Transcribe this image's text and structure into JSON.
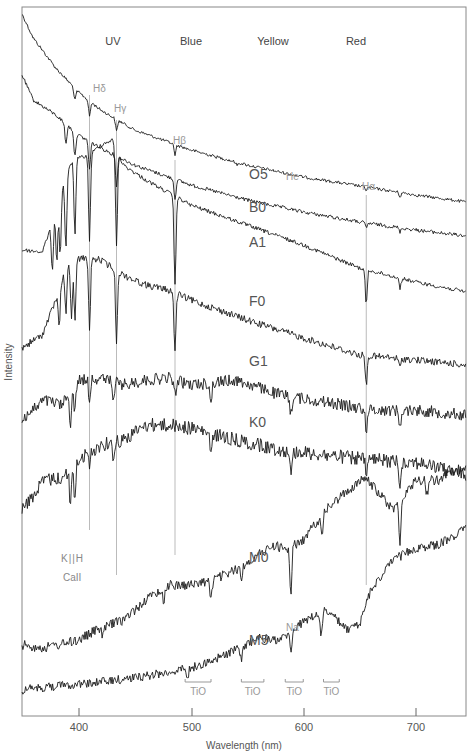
{
  "chart_data": {
    "type": "line",
    "title": "",
    "xlabel": "Wavelength (nm)",
    "ylabel": "Intensity",
    "xlim": [
      350,
      745
    ],
    "xticks": [
      400,
      500,
      600,
      700
    ],
    "grid": false,
    "color_bands": [
      {
        "label": "UV",
        "x": 418
      },
      {
        "label": "Blue",
        "x": 486
      },
      {
        "label": "Yellow",
        "x": 560
      },
      {
        "label": "Red",
        "x": 632
      }
    ],
    "series": [
      {
        "name": "O5",
        "label_x": 570,
        "label_y": 173,
        "anchors": [
          [
            350,
            14
          ],
          [
            360,
            38
          ],
          [
            380,
            68
          ],
          [
            400,
            92
          ],
          [
            420,
            110
          ],
          [
            450,
            130
          ],
          [
            500,
            150
          ],
          [
            550,
            165
          ],
          [
            600,
            177
          ],
          [
            650,
            186
          ],
          [
            700,
            195
          ],
          [
            745,
            202
          ]
        ],
        "noise": 1.5,
        "lines": [
          [
            397,
            12
          ],
          [
            410,
            15
          ],
          [
            434,
            12
          ],
          [
            486,
            10
          ],
          [
            541,
            3
          ],
          [
            656,
            3
          ],
          [
            686,
            4
          ]
        ]
      },
      {
        "name": "B0",
        "label_x": 570,
        "label_y": 208,
        "anchors": [
          [
            350,
            75
          ],
          [
            360,
            100
          ],
          [
            380,
            115
          ],
          [
            400,
            135
          ],
          [
            420,
            148
          ],
          [
            450,
            165
          ],
          [
            500,
            185
          ],
          [
            550,
            200
          ],
          [
            600,
            212
          ],
          [
            650,
            222
          ],
          [
            700,
            230
          ],
          [
            745,
            236
          ]
        ],
        "noise": 1.8,
        "lines": [
          [
            389,
            20
          ],
          [
            397,
            25
          ],
          [
            410,
            28
          ],
          [
            434,
            30
          ],
          [
            486,
            20
          ],
          [
            656,
            5
          ],
          [
            686,
            4
          ]
        ]
      },
      {
        "name": "A1",
        "label_x": 570,
        "label_y": 243,
        "anchors": [
          [
            350,
            250
          ],
          [
            368,
            252
          ],
          [
            378,
            220
          ],
          [
            385,
            190
          ],
          [
            395,
            160
          ],
          [
            410,
            155
          ],
          [
            420,
            145
          ],
          [
            430,
            140
          ],
          [
            440,
            165
          ],
          [
            460,
            180
          ],
          [
            500,
            205
          ],
          [
            550,
            225
          ],
          [
            600,
            245
          ],
          [
            650,
            268
          ],
          [
            700,
            282
          ],
          [
            745,
            292
          ]
        ],
        "noise": 2.0,
        "lines": [
          [
            377,
            50
          ],
          [
            381,
            55
          ],
          [
            384,
            60
          ],
          [
            389,
            70
          ],
          [
            397,
            75
          ],
          [
            410,
            85
          ],
          [
            434,
            95
          ],
          [
            486,
            90
          ],
          [
            656,
            35
          ],
          [
            686,
            10
          ]
        ]
      },
      {
        "name": "F0",
        "label_x": 570,
        "label_y": 303,
        "anchors": [
          [
            350,
            348
          ],
          [
            368,
            335
          ],
          [
            380,
            300
          ],
          [
            388,
            270
          ],
          [
            395,
            260
          ],
          [
            405,
            258
          ],
          [
            420,
            260
          ],
          [
            440,
            275
          ],
          [
            460,
            285
          ],
          [
            480,
            290
          ],
          [
            500,
            300
          ],
          [
            550,
            320
          ],
          [
            600,
            338
          ],
          [
            650,
            355
          ],
          [
            700,
            360
          ],
          [
            745,
            365
          ]
        ],
        "noise": 3.5,
        "lines": [
          [
            383,
            40
          ],
          [
            389,
            45
          ],
          [
            394,
            60
          ],
          [
            397,
            60
          ],
          [
            410,
            70
          ],
          [
            434,
            70
          ],
          [
            486,
            60
          ],
          [
            656,
            30
          ],
          [
            686,
            10
          ]
        ]
      },
      {
        "name": "G1",
        "label_x": 570,
        "label_y": 362,
        "anchors": [
          [
            350,
            420
          ],
          [
            370,
            400
          ],
          [
            385,
            405
          ],
          [
            392,
            395
          ],
          [
            400,
            380
          ],
          [
            420,
            378
          ],
          [
            440,
            385
          ],
          [
            460,
            380
          ],
          [
            480,
            378
          ],
          [
            500,
            385
          ],
          [
            540,
            380
          ],
          [
            580,
            395
          ],
          [
            620,
            402
          ],
          [
            660,
            410
          ],
          [
            700,
            410
          ],
          [
            745,
            415
          ]
        ],
        "noise": 6.0,
        "lines": [
          [
            393,
            30
          ],
          [
            397,
            28
          ],
          [
            410,
            20
          ],
          [
            431,
            20
          ],
          [
            486,
            15
          ],
          [
            518,
            22
          ],
          [
            589,
            18
          ],
          [
            656,
            20
          ],
          [
            686,
            20
          ]
        ]
      },
      {
        "name": "K0",
        "label_x": 570,
        "label_y": 423,
        "anchors": [
          [
            350,
            510
          ],
          [
            370,
            480
          ],
          [
            385,
            478
          ],
          [
            393,
            470
          ],
          [
            400,
            460
          ],
          [
            420,
            445
          ],
          [
            440,
            440
          ],
          [
            460,
            425
          ],
          [
            480,
            425
          ],
          [
            500,
            428
          ],
          [
            540,
            440
          ],
          [
            580,
            450
          ],
          [
            620,
            455
          ],
          [
            660,
            460
          ],
          [
            700,
            462
          ],
          [
            745,
            475
          ]
        ],
        "noise": 7.0,
        "lines": [
          [
            393,
            35
          ],
          [
            397,
            35
          ],
          [
            410,
            15
          ],
          [
            431,
            15
          ],
          [
            518,
            25
          ],
          [
            589,
            25
          ],
          [
            656,
            15
          ],
          [
            686,
            25
          ]
        ]
      },
      {
        "name": "M0",
        "label_x": 570,
        "label_y": 558,
        "anchors": [
          [
            350,
            645
          ],
          [
            370,
            648
          ],
          [
            400,
            640
          ],
          [
            420,
            628
          ],
          [
            440,
            620
          ],
          [
            460,
            600
          ],
          [
            480,
            585
          ],
          [
            500,
            585
          ],
          [
            520,
            580
          ],
          [
            540,
            570
          ],
          [
            560,
            555
          ],
          [
            575,
            545
          ],
          [
            585,
            550
          ],
          [
            600,
            540
          ],
          [
            620,
            510
          ],
          [
            640,
            490
          ],
          [
            655,
            478
          ],
          [
            665,
            490
          ],
          [
            680,
            510
          ],
          [
            700,
            480
          ],
          [
            720,
            480
          ],
          [
            745,
            465
          ]
        ],
        "noise": 5.0,
        "lines": [
          [
            422,
            10
          ],
          [
            476,
            15
          ],
          [
            518,
            20
          ],
          [
            545,
            15
          ],
          [
            589,
            45
          ],
          [
            617,
            20
          ],
          [
            686,
            40
          ],
          [
            710,
            15
          ]
        ]
      },
      {
        "name": "M5",
        "label_x": 570,
        "label_y": 643,
        "anchors": [
          [
            350,
            690
          ],
          [
            380,
            686
          ],
          [
            420,
            682
          ],
          [
            460,
            676
          ],
          [
            500,
            668
          ],
          [
            520,
            660
          ],
          [
            540,
            650
          ],
          [
            560,
            638
          ],
          [
            580,
            640
          ],
          [
            600,
            622
          ],
          [
            620,
            610
          ],
          [
            640,
            630
          ],
          [
            650,
            625
          ],
          [
            660,
            590
          ],
          [
            680,
            560
          ],
          [
            700,
            548
          ],
          [
            720,
            545
          ],
          [
            745,
            528
          ]
        ],
        "noise": 4.5,
        "lines": [
          [
            497,
            12
          ],
          [
            545,
            15
          ],
          [
            589,
            20
          ],
          [
            616,
            25
          ],
          [
            680,
            0
          ]
        ]
      }
    ],
    "line_markers": [
      {
        "label": "Hδ",
        "x": 410,
        "label_y": 100,
        "top": 95,
        "bottom": 530
      },
      {
        "label": "Hγ",
        "x": 434,
        "label_y": 113,
        "top": 120,
        "bottom": 575
      },
      {
        "label": "Hβ",
        "x": 486,
        "label_y": 145,
        "top": 160,
        "bottom": 555
      },
      {
        "label": "Hα",
        "x": 656,
        "label_y": 191,
        "top": 195,
        "bottom": 585
      },
      {
        "label": "He",
        "x": 587,
        "label_y": 178
      }
    ],
    "annotations": {
      "call_kh": "K||H",
      "call": "CaII",
      "na": "Na",
      "tio": [
        "TiO",
        "TiO",
        "TiO",
        "TiO"
      ],
      "tio_ranges": [
        [
          495,
          518
        ],
        [
          545,
          565
        ],
        [
          584,
          600
        ],
        [
          618,
          632
        ]
      ]
    }
  },
  "axis": {
    "xlabel": "Wavelength (nm)",
    "ylabel": "Intensity",
    "ticks": [
      "400",
      "500",
      "600",
      "700"
    ]
  },
  "bands": [
    "UV",
    "Blue",
    "Yellow",
    "Red"
  ],
  "classes": [
    "O5",
    "B0",
    "A1",
    "F0",
    "G1",
    "K0",
    "M0",
    "M5"
  ]
}
